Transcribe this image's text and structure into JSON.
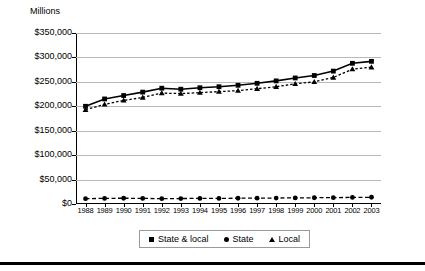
{
  "axis_title": "Millions",
  "legend": {
    "items": [
      {
        "label": "State & local",
        "marker": "square-marker"
      },
      {
        "label": "State",
        "marker": "circle-marker"
      },
      {
        "label": "Local",
        "marker": "triangle-marker"
      }
    ]
  },
  "yticks": [
    "$350,000",
    "$300,000",
    "$250,000",
    "$200,000",
    "$150,000",
    "$100,000",
    "$50,000",
    "$0"
  ],
  "chart_data": {
    "type": "line",
    "title": "",
    "subtitle": "",
    "xlabel": "",
    "ylabel": "Millions",
    "ylim": [
      0,
      350000
    ],
    "ytick_values": [
      0,
      50000,
      100000,
      150000,
      200000,
      250000,
      300000,
      350000
    ],
    "grid": true,
    "legend_position": "bottom",
    "categories": [
      "1988",
      "1989",
      "1990",
      "1991",
      "1992",
      "1993",
      "1994",
      "1995",
      "1996",
      "1997",
      "1998",
      "1999",
      "2000",
      "2001",
      "2002",
      "2003"
    ],
    "series": [
      {
        "name": "State & local",
        "marker": "square",
        "linestyle": "solid",
        "color": "#000000",
        "values": [
          200000,
          215000,
          222000,
          229000,
          237000,
          235000,
          238000,
          240000,
          243000,
          247000,
          252000,
          258000,
          263000,
          272000,
          288000,
          292000
        ]
      },
      {
        "name": "Local",
        "marker": "triangle",
        "linestyle": "dotted",
        "color": "#000000",
        "values": [
          193000,
          204000,
          212000,
          218000,
          227000,
          226000,
          228000,
          230000,
          232000,
          236000,
          240000,
          246000,
          250000,
          259000,
          276000,
          280000
        ]
      },
      {
        "name": "State",
        "marker": "circle",
        "linestyle": "dashed",
        "color": "#000000",
        "values": [
          11000,
          11500,
          11800,
          11500,
          11000,
          11200,
          11500,
          11500,
          11800,
          12000,
          12200,
          12500,
          12800,
          13000,
          13500,
          13800
        ]
      }
    ]
  }
}
